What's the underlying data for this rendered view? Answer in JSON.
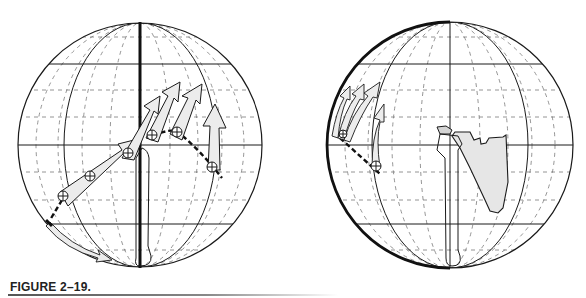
{
  "figure": {
    "caption": "FIGURE 2–19.",
    "panels": [
      {
        "id": "left",
        "description": "Globe grid with humerus positions; sequence of arrows showing arm elevation path",
        "center": [
          140,
          145
        ],
        "radius": 122,
        "highlighted_meridian": "central",
        "position_markers": 6,
        "arrows": 6
      },
      {
        "id": "right",
        "description": "Globe grid rotated view with humerus and scapula outline; arrows at left limb of globe",
        "center": [
          450,
          145
        ],
        "radius": 123,
        "highlighted_meridian": "left-limb",
        "position_markers": 2,
        "arrows": 4
      }
    ]
  },
  "colors": {
    "ink": "#1a1a1a",
    "grid_dashed": "#777777",
    "arrow_fill": "#ececec",
    "scapula_fill": "#e6e6e6",
    "background": "#ffffff"
  }
}
